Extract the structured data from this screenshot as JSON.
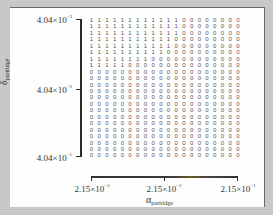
{
  "chart_data": {
    "type": "heatmap",
    "title": "",
    "xlabel": "α_partridge",
    "ylabel": "δ_partridge",
    "x_scale": "log",
    "y_scale": "log",
    "x_ticks": [
      "2.15×10⁻³",
      "2.15×10⁻²",
      "2.15×10⁻¹"
    ],
    "y_ticks": [
      "4.04×10⁻³",
      "4.04×10⁻²",
      "4.04×10⁻¹"
    ],
    "xlim": [
      0.00215,
      0.215
    ],
    "ylim": [
      0.00404,
      0.404
    ],
    "n_cols": 20,
    "n_rows": 22,
    "ones_per_row": [
      12,
      12,
      12,
      11,
      11,
      10,
      8,
      5,
      0,
      0,
      0,
      0,
      0,
      0,
      0,
      0,
      0,
      0,
      0,
      0,
      0,
      0
    ],
    "cell_values_note": "Each row begins with the listed count of 1s followed by 0s to fill 20 columns; top row corresponds to smallest δ."
  },
  "labels": {
    "y_top": {
      "base": "4.04×10",
      "exp": "−3"
    },
    "y_mid": {
      "base": "4.04×10",
      "exp": "−2"
    },
    "y_bot": {
      "base": "4.04×10",
      "exp": "−1"
    },
    "x_left": {
      "base": "2.15×10",
      "exp": "−3"
    },
    "x_mid": {
      "base": "2.15×10",
      "exp": "−2"
    },
    "x_right": {
      "base": "2.15×10",
      "exp": "−1"
    },
    "x_title": {
      "sym": "α",
      "sub": "partridge"
    },
    "y_title": {
      "sym": "δ",
      "sub": "partridge"
    }
  },
  "colors": {
    "background": "#c8c8ca",
    "panel": "#fefefe",
    "axis": "#2a2a2a",
    "text": "#555555"
  }
}
